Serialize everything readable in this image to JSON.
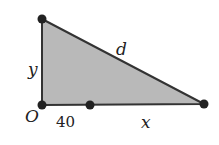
{
  "diagram": {
    "type": "right-triangle",
    "colors": {
      "fill": "#b9b9b9",
      "stroke": "#333333",
      "point": "#222222",
      "text": "#222222"
    },
    "vertices": {
      "top": {
        "x": 42,
        "y": 19
      },
      "origin": {
        "x": 42,
        "y": 105
      },
      "right": {
        "x": 204,
        "y": 104
      }
    },
    "points": [
      {
        "name": "top",
        "x": 42,
        "y": 19
      },
      {
        "name": "origin",
        "x": 42,
        "y": 105
      },
      {
        "name": "mid",
        "x": 90,
        "y": 105
      },
      {
        "name": "right",
        "x": 204,
        "y": 104
      }
    ],
    "labels": {
      "origin": "O",
      "vertical_side": "y",
      "hypotenuse": "d",
      "base_segment": "40",
      "base_remainder": "x"
    }
  }
}
